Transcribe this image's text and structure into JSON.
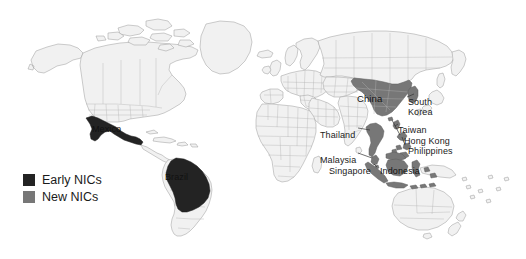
{
  "map": {
    "title": "World map of Newly Industrialized Countries",
    "background_color": "#ffffff",
    "land_fill": "#f1f1f1",
    "land_stroke": "#9a9a9a",
    "projection_note": "world, Pacific-split omitted; Americas left, Eurasia right"
  },
  "legend": {
    "items": [
      {
        "label": "Early NICs",
        "color": "#232323",
        "swatch_name": "early-nics-swatch"
      },
      {
        "label": "New NICs",
        "color": "#777777",
        "swatch_name": "new-nics-swatch"
      }
    ]
  },
  "labels": [
    {
      "id": "mexico",
      "text": "Mexico",
      "category": "Early NICs",
      "on_dark": true,
      "x": 92,
      "y": 124
    },
    {
      "id": "brazil",
      "text": "Brazil",
      "category": "Early NICs",
      "on_dark": true,
      "x": 165,
      "y": 172
    },
    {
      "id": "china",
      "text": "China",
      "category": "New NICs",
      "on_dark": true,
      "x": 357,
      "y": 94
    },
    {
      "id": "south-korea",
      "text": "South\nKorea",
      "category": "New NICs",
      "on_dark": false,
      "x": 408,
      "y": 97
    },
    {
      "id": "taiwan",
      "text": "Taiwan",
      "category": "New NICs",
      "on_dark": false,
      "x": 398,
      "y": 125
    },
    {
      "id": "hong-kong",
      "text": "Hong Kong",
      "category": "New NICs",
      "on_dark": false,
      "x": 404,
      "y": 136
    },
    {
      "id": "philippines",
      "text": "Philippines",
      "category": "New NICs",
      "on_dark": false,
      "x": 408,
      "y": 146
    },
    {
      "id": "thailand",
      "text": "Thailand",
      "category": "New NICs",
      "on_dark": false,
      "x": 320,
      "y": 130
    },
    {
      "id": "malaysia",
      "text": "Malaysia",
      "category": "New NICs",
      "on_dark": false,
      "x": 320,
      "y": 155
    },
    {
      "id": "singapore",
      "text": "Singapore",
      "category": "New NICs",
      "on_dark": false,
      "x": 329,
      "y": 166
    },
    {
      "id": "indonesia",
      "text": "Indonesia",
      "category": "New NICs",
      "on_dark": true,
      "x": 380,
      "y": 166
    }
  ],
  "regions": {
    "early_nics": [
      "Mexico",
      "Brazil"
    ],
    "new_nics": [
      "China",
      "South Korea",
      "Taiwan",
      "Hong Kong",
      "Philippines",
      "Thailand",
      "Malaysia",
      "Singapore",
      "Indonesia"
    ]
  }
}
